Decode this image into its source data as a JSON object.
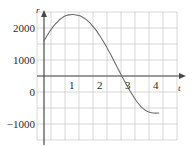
{
  "figure": {
    "background_color": "#ffffff",
    "grid_color": "#b9b9b9",
    "axis_color": "#4a4a4a",
    "curve_color": "#6e6e6e",
    "text_color": "#2b2b2b"
  },
  "axis_names": {
    "y": "r",
    "x": "t"
  },
  "y_tick_labels": {
    "t2000": "2000",
    "t1000": "1000",
    "t0": "0",
    "tm1000": "−1000"
  },
  "x_tick_labels": {
    "t1": "1",
    "t2": "2",
    "t3": "3",
    "t4": "4"
  },
  "chart_data": {
    "type": "line",
    "title": "",
    "xlabel": "t",
    "ylabel": "r",
    "xlim": [
      -0.25,
      4.5
    ],
    "ylim": [
      -1500,
      2500
    ],
    "xticks": [
      0,
      1,
      2,
      3,
      4
    ],
    "yticks": [
      -1000,
      0,
      1000,
      2000
    ],
    "x_minor_step": 0.5,
    "y_minor_step": 500,
    "grid": true,
    "legend": false,
    "legend_position": "none",
    "series": [
      {
        "name": "r(t)",
        "x": [
          0.0,
          0.1,
          0.2,
          0.3,
          0.4,
          0.5,
          0.6,
          0.7,
          0.8,
          0.9,
          1.0,
          1.1,
          1.2,
          1.25,
          1.3,
          1.4,
          1.5,
          1.6,
          1.7,
          1.8,
          1.9,
          2.0,
          2.1,
          2.2,
          2.3,
          2.4,
          2.5,
          2.6,
          2.7,
          2.8,
          2.9,
          3.0,
          3.1,
          3.2,
          3.3,
          3.4,
          3.5,
          3.6,
          3.7,
          3.8,
          3.9,
          4.0,
          4.1
        ],
        "y": [
          1100,
          1250,
          1390,
          1510,
          1620,
          1710,
          1790,
          1850,
          1890,
          1910,
          1920,
          1915,
          1900,
          1890,
          1875,
          1830,
          1770,
          1690,
          1600,
          1495,
          1380,
          1250,
          1110,
          960,
          800,
          640,
          470,
          300,
          130,
          -40,
          -200,
          -360,
          -510,
          -650,
          -780,
          -890,
          -990,
          -1060,
          -1110,
          -1140,
          -1155,
          -1160,
          -1155
        ]
      }
    ],
    "annotations": {
      "peak_t": 1.25,
      "peak_r": 1900,
      "zero_crossing_t": 3.0,
      "start_r": 1100,
      "end_t": 4.1,
      "end_r": -1155
    }
  }
}
